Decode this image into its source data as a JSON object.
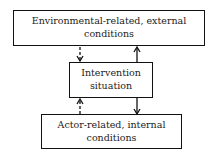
{
  "diagram": {
    "top_box": {
      "label": "Environmental-related, external conditions"
    },
    "middle_box": {
      "label": "Intervention situation"
    },
    "bottom_box": {
      "label": "Actor-related, internal conditions"
    },
    "arrows": [
      {
        "from": "top_box",
        "to": "middle_box",
        "style": "dashed"
      },
      {
        "from": "middle_box",
        "to": "top_box",
        "style": "solid"
      },
      {
        "from": "bottom_box",
        "to": "middle_box",
        "style": "dashed"
      },
      {
        "from": "middle_box",
        "to": "bottom_box",
        "style": "solid"
      }
    ]
  }
}
